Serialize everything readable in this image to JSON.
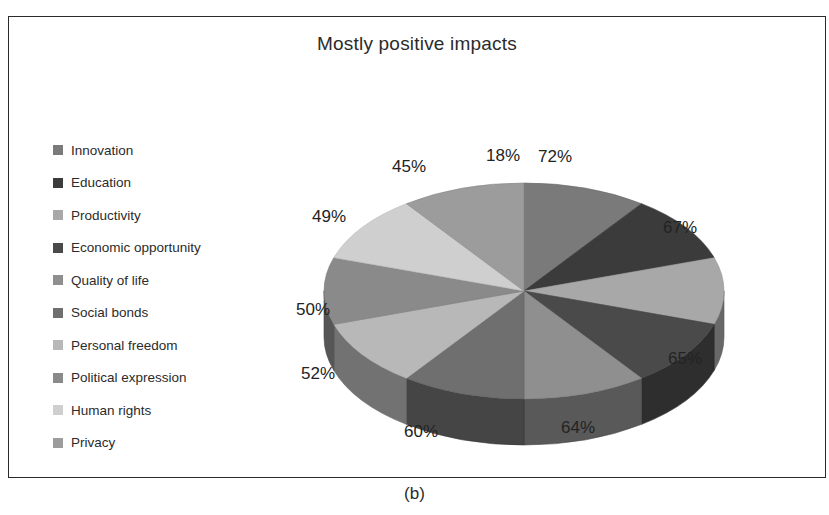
{
  "figure": {
    "caption": "(b)",
    "title": "Mostly positive impacts",
    "top_bleed": "",
    "ghost_text_1": "exploiting users",
    "ghost_text_2": "unblocking access"
  },
  "legend": {
    "items": [
      {
        "label": "Innovation",
        "color": "#7a7a7a"
      },
      {
        "label": "Education",
        "color": "#3b3b3b"
      },
      {
        "label": "Productivity",
        "color": "#a8a8a8"
      },
      {
        "label": "Economic opportunity",
        "color": "#4a4a4a"
      },
      {
        "label": "Quality of life",
        "color": "#8f8f8f"
      },
      {
        "label": "Social bonds",
        "color": "#6f6f6f"
      },
      {
        "label": "Personal freedom",
        "color": "#b8b8b8"
      },
      {
        "label": "Political expression",
        "color": "#8a8a8a"
      },
      {
        "label": "Human rights",
        "color": "#cfcfcf"
      },
      {
        "label": "Privacy",
        "color": "#9c9c9c"
      }
    ]
  },
  "chart_data": {
    "type": "pie",
    "title": "Mostly positive impacts",
    "subtype": "3d-pie",
    "legend_position": "left",
    "unit": "%",
    "categories": [
      "Innovation",
      "Education",
      "Productivity",
      "Economic opportunity",
      "Quality of life",
      "Social bonds",
      "Personal freedom",
      "Political expression",
      "Human rights",
      "Privacy"
    ],
    "values": [
      72,
      67,
      65,
      64,
      60,
      52,
      50,
      49,
      45,
      18
    ],
    "labels": [
      "72%",
      "67%",
      "65%",
      "64%",
      "60%",
      "52%",
      "50%",
      "49%",
      "45%",
      "18%"
    ],
    "colors": [
      "#7a7a7a",
      "#3b3b3b",
      "#a8a8a8",
      "#4a4a4a",
      "#8f8f8f",
      "#6f6f6f",
      "#b8b8b8",
      "#8a8a8a",
      "#cfcfcf",
      "#9c9c9c"
    ],
    "slice_order": "clockwise from 12 o'clock",
    "slice_angles_deg": [
      36,
      36,
      36,
      36,
      36,
      36,
      36,
      36,
      36,
      36
    ]
  },
  "pie_labels": [
    {
      "text": "72%",
      "x": 242,
      "y": 6
    },
    {
      "text": "67%",
      "x": 367,
      "y": 77
    },
    {
      "text": "65%",
      "x": 372,
      "y": 208
    },
    {
      "text": "64%",
      "x": 265,
      "y": 277
    },
    {
      "text": "60%",
      "x": 108,
      "y": 281
    },
    {
      "text": "52%",
      "x": 5,
      "y": 223
    },
    {
      "text": "50%",
      "x": 0,
      "y": 159
    },
    {
      "text": "49%",
      "x": 16,
      "y": 66
    },
    {
      "text": "45%",
      "x": 96,
      "y": 16
    },
    {
      "text": "18%",
      "x": 190,
      "y": 5
    }
  ]
}
